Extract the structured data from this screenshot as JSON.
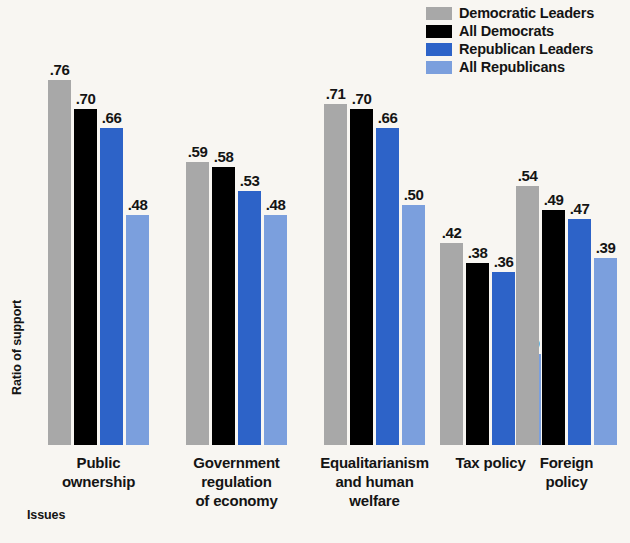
{
  "chart_data": {
    "type": "bar",
    "title": "",
    "xlabel": "Issues",
    "ylabel": "Ratio of support",
    "ylim": [
      0,
      0.8
    ],
    "grid": false,
    "legend_position": "top-right",
    "categories": [
      "Public ownership",
      "Government regulation of economy",
      "Equalitarianism and human welfare",
      "Tax policy",
      "Foreign policy"
    ],
    "category_lines": [
      [
        "Public",
        "ownership"
      ],
      [
        "Government",
        "regulation",
        "of economy"
      ],
      [
        "Equalitarianism",
        "and human",
        "welfare"
      ],
      [
        "Tax policy"
      ],
      [
        "Foreign",
        "policy"
      ]
    ],
    "series": [
      {
        "name": "Democratic Leaders",
        "color": "#a8a8a8",
        "values": [
          0.76,
          0.59,
          0.71,
          0.42,
          0.54
        ],
        "labels": [
          ".76",
          ".59",
          ".71",
          ".42",
          ".54"
        ]
      },
      {
        "name": "All Democrats",
        "color": "#000000",
        "values": [
          0.7,
          0.58,
          0.7,
          0.38,
          0.49
        ],
        "labels": [
          ".70",
          ".58",
          ".70",
          ".38",
          ".49"
        ]
      },
      {
        "name": "Republican Leaders",
        "color": "#2d63c8",
        "values": [
          0.66,
          0.53,
          0.66,
          0.36,
          0.47
        ],
        "labels": [
          ".66",
          ".53",
          ".66",
          ".36",
          ".47"
        ]
      },
      {
        "name": "All Republicans",
        "color": "#7b9fdd",
        "values": [
          0.48,
          0.48,
          0.5,
          0.19,
          0.39
        ],
        "labels": [
          ".48",
          ".48",
          ".50",
          ".19",
          ".39"
        ]
      }
    ]
  },
  "legend": {
    "items": [
      {
        "label": "Democratic Leaders",
        "color": "#a8a8a8"
      },
      {
        "label": "All Democrats",
        "color": "#000000"
      },
      {
        "label": "Republican Leaders",
        "color": "#2d63c8"
      },
      {
        "label": "All Republicans",
        "color": "#7b9fdd"
      }
    ]
  },
  "axes": {
    "y_title": "Ratio of support",
    "x_title": "Issues"
  },
  "colors": {
    "background": "#f8f6f2",
    "text": "#141414",
    "democratic_leaders": "#a8a8a8",
    "all_democrats": "#000000",
    "republican_leaders": "#2d63c8",
    "all_republicans": "#7b9fdd"
  },
  "layout": {
    "baseline_y": 445,
    "pixels_per_unit": 480,
    "group_left_positions": [
      48,
      186,
      324,
      440,
      516
    ],
    "bar_width": 23,
    "bar_gap": 3
  }
}
